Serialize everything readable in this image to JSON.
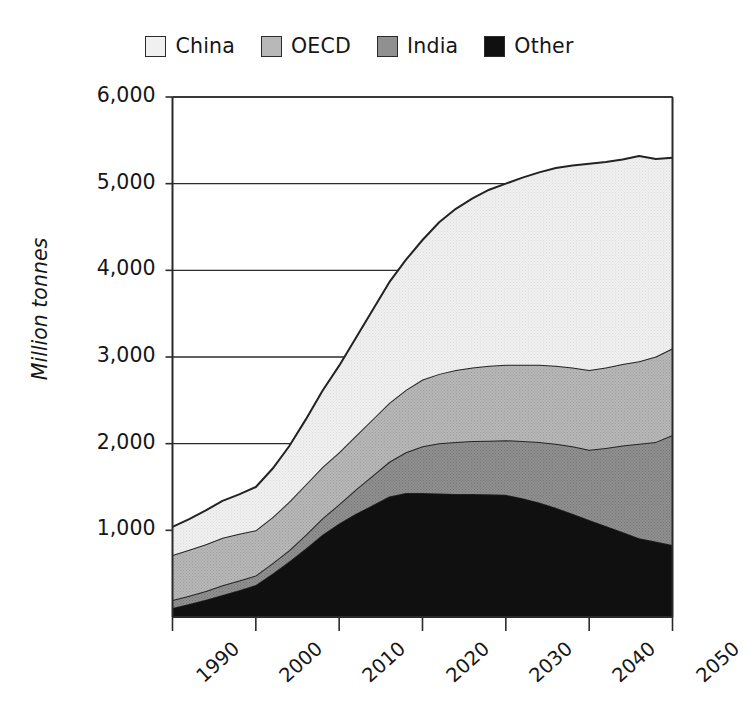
{
  "chart_data": {
    "type": "area",
    "stacked": true,
    "title": "",
    "xlabel": "",
    "ylabel": "Million tonnes",
    "xlim": [
      1990,
      2050
    ],
    "ylim": [
      0,
      6000
    ],
    "grid": true,
    "legend_position": "top",
    "y_ticks": [
      "1,000",
      "2,000",
      "3,000",
      "4,000",
      "5,000",
      "6,000"
    ],
    "y_tick_values": [
      1000,
      2000,
      3000,
      4000,
      5000,
      6000
    ],
    "x_ticks": [
      "1990",
      "2000",
      "2010",
      "2020",
      "2030",
      "2040",
      "2050"
    ],
    "x_tick_values": [
      1990,
      2000,
      2010,
      2020,
      2030,
      2040,
      2050
    ],
    "stack_order_bottom_to_top": [
      "Other",
      "India",
      "OECD",
      "China"
    ],
    "x": [
      1990,
      1992,
      1994,
      1996,
      1998,
      2000,
      2002,
      2004,
      2006,
      2008,
      2010,
      2012,
      2014,
      2016,
      2018,
      2020,
      2022,
      2024,
      2026,
      2028,
      2030,
      2032,
      2034,
      2036,
      2038,
      2040,
      2042,
      2044,
      2046,
      2048,
      2050
    ],
    "series": [
      {
        "name": "Other",
        "color": "#101010",
        "values": [
          105,
          150,
          200,
          255,
          310,
          370,
          500,
          640,
          790,
          950,
          1080,
          1190,
          1290,
          1390,
          1430,
          1430,
          1425,
          1420,
          1420,
          1415,
          1410,
          1370,
          1320,
          1260,
          1190,
          1120,
          1050,
          980,
          910,
          870,
          830
        ]
      },
      {
        "name": "India",
        "color": "#909090",
        "values": [
          90,
          95,
          100,
          110,
          110,
          110,
          120,
          130,
          160,
          190,
          220,
          280,
          340,
          400,
          470,
          540,
          580,
          600,
          610,
          620,
          630,
          660,
          700,
          740,
          780,
          810,
          900,
          1000,
          1090,
          1150,
          1270
        ]
      },
      {
        "name": "OECD",
        "color": "#b8b8b8",
        "values": [
          520,
          530,
          540,
          550,
          540,
          520,
          530,
          560,
          580,
          590,
          600,
          620,
          650,
          680,
          720,
          770,
          800,
          830,
          850,
          865,
          870,
          880,
          890,
          900,
          910,
          920,
          930,
          940,
          950,
          985,
          1000
        ]
      },
      {
        "name": "China",
        "color": "#f0f0f0",
        "values": [
          325,
          355,
          390,
          425,
          455,
          500,
          560,
          640,
          750,
          880,
          1000,
          1130,
          1260,
          1390,
          1500,
          1610,
          1750,
          1860,
          1950,
          2030,
          2090,
          2160,
          2220,
          2280,
          2330,
          2380,
          2370,
          2360,
          2370,
          2280,
          2200
        ]
      }
    ],
    "totals_note": "Totals rise from about 1,040 in 1990 to about 5,300 in 2050"
  },
  "legend": {
    "items": [
      {
        "label": "China",
        "color": "#f0f0f0"
      },
      {
        "label": "OECD",
        "color": "#b8b8b8"
      },
      {
        "label": "India",
        "color": "#909090"
      },
      {
        "label": "Other",
        "color": "#101010"
      }
    ]
  },
  "axes": {
    "y_title": "Million tonnes"
  }
}
